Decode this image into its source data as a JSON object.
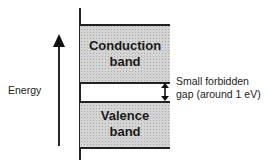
{
  "diagram": {
    "axis_label": "Energy",
    "bands": [
      {
        "name": "conduction",
        "line1": "Conduction",
        "line2": "band"
      },
      {
        "name": "valence",
        "line1": "Valence",
        "line2": "band"
      }
    ],
    "gap_label_line1": "Small forbidden",
    "gap_label_line2": "gap (around 1 eV)",
    "colors": {
      "band_fill": "#d4d4d4",
      "line": "#222222",
      "background": "#ffffff"
    }
  }
}
